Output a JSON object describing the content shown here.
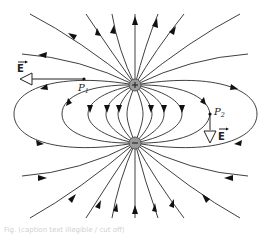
{
  "diagram": {
    "charges": [
      {
        "id": "positive",
        "symbol": "+",
        "x": 135,
        "y": 85,
        "r": 6,
        "color": "#9a9a9a"
      },
      {
        "id": "negative",
        "symbol": "−",
        "x": 135,
        "y": 143,
        "r": 6,
        "color": "#9a9a9a"
      }
    ],
    "points": [
      {
        "id": "P1",
        "label": "P",
        "subscript": "1",
        "x": 84,
        "y": 79,
        "field_vector": {
          "label": "E",
          "direction": "left",
          "to_x": 20,
          "to_y": 79
        }
      },
      {
        "id": "P2",
        "label": "P",
        "subscript": "2",
        "x": 210,
        "y": 114,
        "field_vector": {
          "label": "E",
          "direction": "down",
          "to_x": 210,
          "to_y": 140
        }
      }
    ],
    "field_line_direction": "from + charge to − charge",
    "line_color": "#2a2a2a",
    "caption": "Fig. (caption text illegible / cut off)"
  }
}
